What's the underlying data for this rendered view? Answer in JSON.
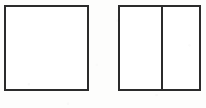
{
  "figure": {
    "background_color": "#fdfdfc",
    "stroke_color": "#2b2b2b",
    "fill_color": "#ffffff",
    "stroke_width_px": 2,
    "canvas": {
      "width": 206,
      "height": 108
    },
    "caption": "",
    "shapes": [
      {
        "name": "undivided-square",
        "type": "rectangle",
        "label": "",
        "x": 4,
        "y": 5,
        "width": 85,
        "height": 86,
        "divisions": 0,
        "dividers": []
      },
      {
        "name": "divided-square",
        "type": "rectangle",
        "label": "",
        "x": 118,
        "y": 5,
        "width": 83,
        "height": 86,
        "divisions": 2,
        "dividers": [
          {
            "name": "vertical-divider",
            "orientation": "vertical",
            "offset": 43
          }
        ]
      }
    ]
  }
}
